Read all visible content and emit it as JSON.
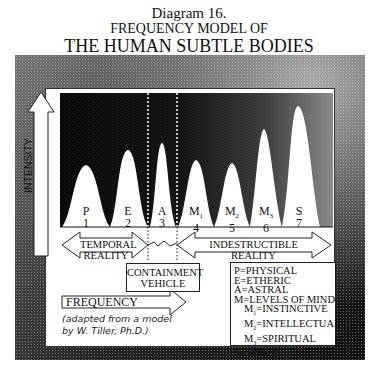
{
  "title": {
    "line1": "Diagram 16.",
    "line2": "FREQUENCY MODEL OF",
    "line3": "THE HUMAN SUBTLE BODIES"
  },
  "axes": {
    "y_label": "INTENSITY",
    "x_label": "FREQUENCY"
  },
  "peaks": [
    {
      "letter": "P",
      "sub": "",
      "number": "1"
    },
    {
      "letter": "E",
      "sub": "",
      "number": "2"
    },
    {
      "letter": "A",
      "sub": "",
      "number": "3"
    },
    {
      "letter": "M",
      "sub": "1",
      "number": "4"
    },
    {
      "letter": "M",
      "sub": "2",
      "number": "5"
    },
    {
      "letter": "M",
      "sub": "3",
      "number": "6"
    },
    {
      "letter": "S",
      "sub": "",
      "number": "7"
    }
  ],
  "regions": {
    "temporal": {
      "line1": "TEMPORAL",
      "line2": "REALITY"
    },
    "indestructible": {
      "line1": "INDESTRUCTIBLE",
      "line2": "REALITY"
    },
    "containment": {
      "line1": "CONTAINMENT",
      "line2": "VEHICLE"
    }
  },
  "legend": [
    {
      "key": "P",
      "sub": "",
      "value": "=PHYSICAL",
      "indent": false
    },
    {
      "key": "E",
      "sub": "",
      "value": "=ETHERIC",
      "indent": false
    },
    {
      "key": "A",
      "sub": "",
      "value": "=ASTRAL",
      "indent": false
    },
    {
      "key": "M",
      "sub": "",
      "value": "=LEVELS OF MIND",
      "indent": false
    },
    {
      "key": "M",
      "sub": "1",
      "value": "=INSTINCTIVE",
      "indent": true
    },
    {
      "key": "M",
      "sub": "2",
      "value": "=INTELLECTUAL",
      "indent": true
    },
    {
      "key": "M",
      "sub": "3",
      "value": "=SPIRITUAL",
      "indent": true
    },
    {
      "key": "S",
      "sub": "",
      "value": "=SPIRIT",
      "indent": false
    }
  ],
  "citation": {
    "line1": "(adapted from a model",
    "line2": "by W. Tiller, Ph.D.)"
  },
  "colors": {
    "chart_bg": "#0a0a0a",
    "peak_fill": "#ffffff",
    "frame_dark": "#1a1a1a",
    "frame_light": "#9a9a9a"
  }
}
